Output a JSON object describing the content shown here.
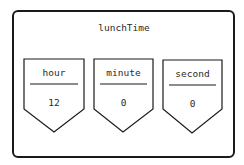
{
  "object": {
    "name": "lunchTime",
    "fields": [
      {
        "label": "hour",
        "value": "12"
      },
      {
        "label": "minute",
        "value": "0"
      },
      {
        "label": "second",
        "value": "0"
      }
    ]
  },
  "colors": {
    "stroke": "#1a1a1a",
    "background": "#ffffff"
  }
}
